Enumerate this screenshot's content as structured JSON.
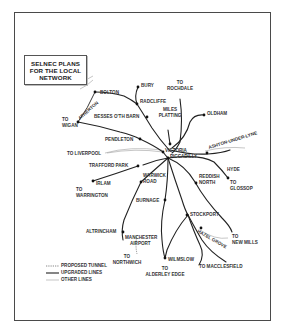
{
  "title": {
    "lines": [
      "SELNEC PLANS",
      "FOR THE LOCAL",
      "NETWORK"
    ]
  },
  "stations": {
    "bolton": "BOLTON",
    "bury": "BURY",
    "to_rochdale_1": "TO",
    "to_rochdale_2": "ROCHDALE",
    "radcliffe": "RADCLIFFE",
    "atherton": "ATHERTON",
    "to_wigan_1": "TO",
    "to_wigan_2": "WIGAN",
    "besses": "BESSES O'TH BARN",
    "miles_platting_1": "MILES",
    "miles_platting_2": "PLATTING",
    "oldham": "OLDHAM",
    "pendleton": "PENDLETON",
    "ashton": "ASHTON-UNDER-LYNE",
    "victoria": "VICTORIA",
    "piccadilly": "PICCADILLY",
    "to_liverpool": "TO LIVERPOOL",
    "trafford_park": "TRAFFORD PARK",
    "hyde": "HYDE",
    "warwick_road_1": "WARWICK",
    "warwick_road_2": "ROAD",
    "reddish_north_1": "REDDISH",
    "reddish_north_2": "NORTH",
    "to_glossop_1": "TO",
    "to_glossop_2": "GLOSSOP",
    "irlam": "IRLAM",
    "to_warrington_1": "TO",
    "to_warrington_2": "WARRINGTON",
    "burnage": "BURNAGE",
    "stockport": "STOCKPORT",
    "altrincham": "ALTRINCHAM",
    "manchester_airport_1": "MANCHESTER",
    "manchester_airport_2": "AIRPORT",
    "to_new_mills_1": "TO",
    "to_new_mills_2": "NEW MILLS",
    "hazel_grove": "HAZEL GROVE",
    "to_northwich_1": "TO",
    "to_northwich_2": "NORTHWICH",
    "wilmslow": "WILMSLOW",
    "to_macclesfield": "TO MACCLESFIELD",
    "to_alderley_1": "TO",
    "to_alderley_2": "ALDERLEY EDGE"
  },
  "legend": [
    {
      "style": "dotted",
      "label": "PROPOSED TUNNEL"
    },
    {
      "style": "solid",
      "label": "UPGRADED LINES"
    },
    {
      "style": "thin",
      "label": "OTHER LINES"
    }
  ],
  "colors": {
    "line": "#222222",
    "other_line": "#9a9a9a",
    "frame": "#4a4a4a",
    "text": "#333333"
  }
}
